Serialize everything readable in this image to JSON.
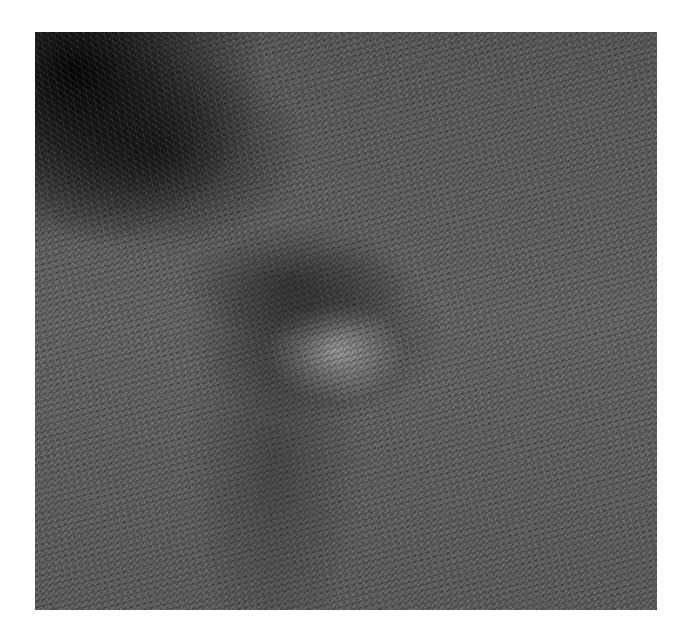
{
  "image": {
    "description": "Grayscale photograph of a lawn with dark shadow in the upper-left corner and a lighter circular patch of grass near the center surrounded by darker grass",
    "background_color": "#ffffff",
    "photo_bounds": {
      "x": 35,
      "y": 32,
      "width": 622,
      "height": 578
    }
  }
}
